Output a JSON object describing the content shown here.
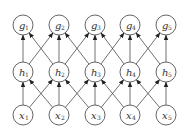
{
  "diagram": {
    "type": "layered-network",
    "node_radius": 10,
    "x_positions": [
      23,
      59,
      95,
      130,
      166
    ],
    "layers": [
      {
        "name": "input",
        "y": 115,
        "nodes": [
          {
            "id": "x1",
            "symbol": "x",
            "subscript": "1"
          },
          {
            "id": "x2",
            "symbol": "x",
            "subscript": "2"
          },
          {
            "id": "x3",
            "symbol": "x",
            "subscript": "3"
          },
          {
            "id": "x4",
            "symbol": "x",
            "subscript": "4"
          },
          {
            "id": "x5",
            "symbol": "x",
            "subscript": "5"
          }
        ]
      },
      {
        "name": "hidden",
        "y": 72,
        "nodes": [
          {
            "id": "h1",
            "symbol": "h",
            "subscript": "1"
          },
          {
            "id": "h2",
            "symbol": "h",
            "subscript": "2"
          },
          {
            "id": "h3",
            "symbol": "h",
            "subscript": "3"
          },
          {
            "id": "h4",
            "symbol": "h",
            "subscript": "4"
          },
          {
            "id": "h5",
            "symbol": "h",
            "subscript": "5"
          }
        ]
      },
      {
        "name": "output",
        "y": 25,
        "nodes": [
          {
            "id": "g1",
            "symbol": "g",
            "subscript": "1"
          },
          {
            "id": "g2",
            "symbol": "g",
            "subscript": "2"
          },
          {
            "id": "g3",
            "symbol": "g",
            "subscript": "3"
          },
          {
            "id": "g4",
            "symbol": "g",
            "subscript": "4"
          },
          {
            "id": "g5",
            "symbol": "g",
            "subscript": "5"
          }
        ]
      }
    ],
    "connectivity": "each node connects to nodes i-1, i, i+1 in the layer above",
    "edge_style": "directed-arrow-upward"
  }
}
